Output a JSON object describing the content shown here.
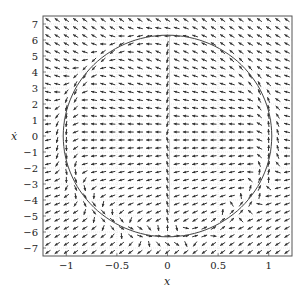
{
  "chart_data": {
    "type": "quiver",
    "title": "",
    "xlabel": "x",
    "ylabel": "ẋ",
    "xlim": [
      -1.23,
      1.23
    ],
    "ylim": [
      -7.5,
      7.5
    ],
    "xticks": [
      -1,
      -0.5,
      0,
      0.5,
      1
    ],
    "xtick_labels": [
      "−1",
      "−0.5",
      "0",
      "0.5",
      "1"
    ],
    "yticks": [
      7,
      6,
      5,
      4,
      3,
      2,
      1,
      0,
      -1,
      -2,
      -3,
      -4,
      -5,
      -6,
      -7
    ],
    "ytick_labels": [
      "7",
      "6",
      "5",
      "4",
      "3",
      "2",
      "1",
      "0",
      "−1",
      "−2",
      "−3",
      "−4",
      "−5",
      "−6",
      "−7"
    ],
    "grid": true,
    "quiver_grid": {
      "nx": 27,
      "ny": 30
    },
    "overlay_curve": {
      "type": "ellipse",
      "cx": 0,
      "cy": 0,
      "rx": 1.03,
      "ry": 6.3,
      "description": "closed orbit / boundary curve"
    },
    "vertical_discontinuity": {
      "x": 0.02,
      "segments": [
        [
          0.7,
          6.2
        ],
        [
          -4.8,
          -0.2
        ]
      ]
    },
    "colors": {
      "arrow": "#333333",
      "curve": "#444444",
      "grid": "#dddddd",
      "frame": "#555555"
    }
  },
  "frame": {
    "left": 43,
    "top": 16,
    "right": 292,
    "bottom": 256
  }
}
